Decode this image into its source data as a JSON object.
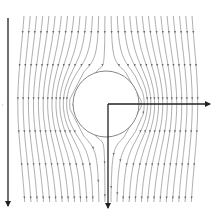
{
  "diagram": {
    "type": "potential flow around a circular cylinder",
    "colors": {
      "background": "#ffffff",
      "streamline": "#8a8a8a",
      "axis": "#222222",
      "cylinder_edge": "#777777"
    },
    "cylinder": {
      "cx": 106,
      "cy": 104,
      "r": 33
    },
    "flow_direction": "downward",
    "streamlines": {
      "count": 28,
      "x_start": 24,
      "x_end": 192,
      "y_top": 16,
      "y_bottom": 202
    },
    "axes": {
      "origin": {
        "x": 108,
        "y": 104
      },
      "x_axis_end": {
        "x": 210,
        "y": 104
      },
      "y_axis_end": {
        "x": 108,
        "y": 208
      }
    },
    "flow_arrow": {
      "x": 8,
      "y_start": 18,
      "y_end": 206
    },
    "side_label": "ı"
  }
}
